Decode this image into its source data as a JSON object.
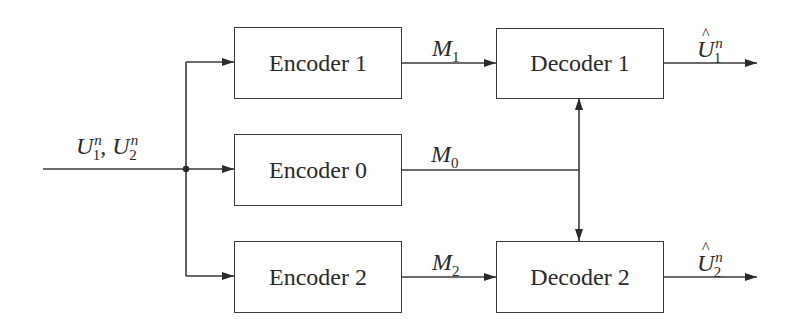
{
  "diagram": {
    "type": "block-diagram",
    "input": {
      "label": "U",
      "subscripts": [
        "1",
        "2"
      ],
      "superscript": "n",
      "text": "U_1^n, U_2^n"
    },
    "encoders": [
      {
        "id": "enc1",
        "label": "Encoder 1",
        "output": {
          "symbol": "M",
          "sub": "1"
        }
      },
      {
        "id": "enc0",
        "label": "Encoder 0",
        "output": {
          "symbol": "M",
          "sub": "0"
        }
      },
      {
        "id": "enc2",
        "label": "Encoder 2",
        "output": {
          "symbol": "M",
          "sub": "2"
        }
      }
    ],
    "decoders": [
      {
        "id": "dec1",
        "label": "Decoder 1",
        "output": {
          "symbol": "U",
          "hat": true,
          "sub": "1",
          "sup": "n"
        }
      },
      {
        "id": "dec2",
        "label": "Decoder 2",
        "output": {
          "symbol": "U",
          "hat": true,
          "sub": "2",
          "sup": "n"
        }
      }
    ],
    "edges": [
      {
        "from": "input",
        "to": "enc1"
      },
      {
        "from": "input",
        "to": "enc0"
      },
      {
        "from": "input",
        "to": "enc2"
      },
      {
        "from": "enc1",
        "to": "dec1",
        "label": "M_1"
      },
      {
        "from": "enc0",
        "to": "dec1",
        "label": "M_0"
      },
      {
        "from": "enc0",
        "to": "dec2",
        "label": "M_0"
      },
      {
        "from": "enc2",
        "to": "dec2",
        "label": "M_2"
      },
      {
        "from": "dec1",
        "to": "output1",
        "label": "Û_1^n"
      },
      {
        "from": "dec2",
        "to": "output2",
        "label": "Û_2^n"
      }
    ],
    "colors": {
      "line": "#3a3a3a",
      "text": "#2a2a2a",
      "background": "#ffffff"
    }
  }
}
